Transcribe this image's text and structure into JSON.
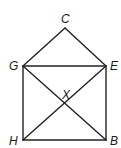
{
  "diagram": {
    "points": {
      "C": {
        "label": "C",
        "x": 65,
        "y": 28
      },
      "G": {
        "label": "G",
        "x": 23,
        "y": 66
      },
      "E": {
        "label": "E",
        "x": 106,
        "y": 66
      },
      "H": {
        "label": "H",
        "x": 23,
        "y": 140
      },
      "B": {
        "label": "B",
        "x": 106,
        "y": 140
      },
      "X": {
        "label": "X"
      }
    },
    "segments": [
      "GC",
      "CE",
      "GE",
      "GH",
      "EB",
      "HB",
      "GB",
      "EH"
    ],
    "colors": {
      "stroke": "#222222",
      "text": "#1a1a1a",
      "background": "#ffffff"
    }
  }
}
